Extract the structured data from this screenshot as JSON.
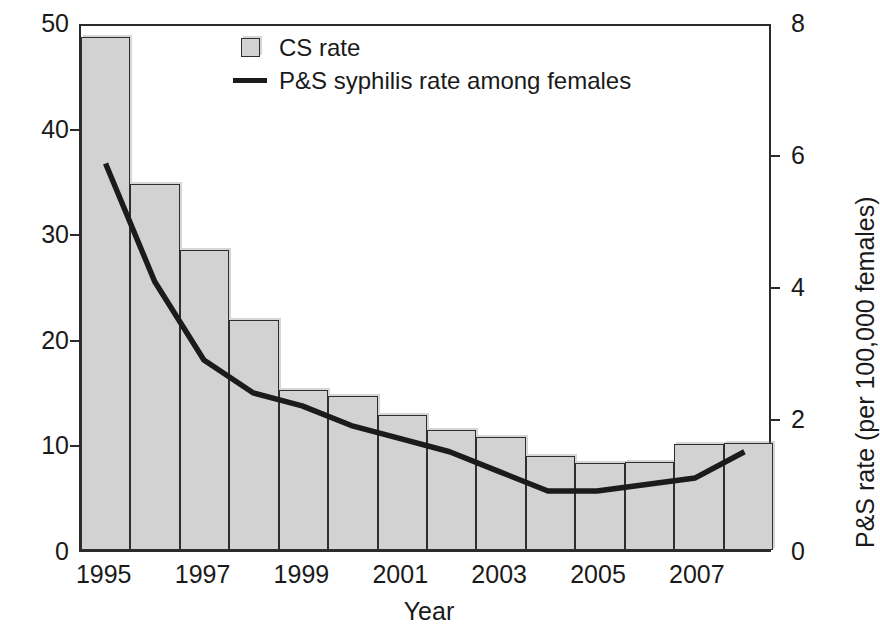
{
  "chart_data": {
    "type": "bar",
    "title": "",
    "xlabel": "Year",
    "ylabel": "CS rate (per 100,000 live births)",
    "y2label": "P&S rate (per 100,000 females)",
    "grid": false,
    "legend_position": "top-center",
    "xlim": [
      1994.5,
      2008.5
    ],
    "ylim": [
      0,
      50
    ],
    "y2lim": [
      0,
      8
    ],
    "yticks": [
      0,
      10,
      20,
      30,
      40,
      50
    ],
    "y2ticks": [
      0,
      2,
      4,
      6,
      8
    ],
    "xticks": [
      "1995",
      "1997",
      "1999",
      "2001",
      "2003",
      "2005",
      "2007"
    ],
    "xtick_values": [
      1995,
      1997,
      1999,
      2001,
      2003,
      2005,
      2007
    ],
    "categories": [
      1995,
      1996,
      1997,
      1998,
      1999,
      2000,
      2001,
      2002,
      2003,
      2004,
      2005,
      2006,
      2007,
      2008
    ],
    "series": [
      {
        "name": "CS rate",
        "type": "bar",
        "axis": "left",
        "values": [
          48.6,
          34.7,
          28.4,
          21.8,
          15.2,
          14.6,
          12.8,
          11.4,
          10.7,
          8.9,
          8.2,
          8.3,
          10.0,
          10.1
        ]
      },
      {
        "name": "P&S syphilis rate among females",
        "type": "line",
        "axis": "right",
        "values": [
          5.9,
          4.1,
          2.9,
          2.4,
          2.2,
          1.9,
          1.7,
          1.5,
          1.2,
          0.9,
          0.9,
          1.0,
          1.1,
          1.5
        ]
      }
    ],
    "legend": [
      "CS rate",
      "P&S syphilis rate among females"
    ],
    "colors": {
      "bar_fill": "#d2d2d2",
      "bar_edge": "#2e2e2e",
      "line": "#1b1b1b",
      "axis": "#2b2b2b",
      "text": "#1a1a1a",
      "background": "#ffffff"
    }
  },
  "legend": {
    "items": [
      {
        "label": "CS rate",
        "key": "bar-swatch-icon"
      },
      {
        "label": "P&S syphilis rate among females",
        "key": "line-swatch-icon"
      }
    ]
  },
  "axes": {
    "left": {
      "title": "CS rate (per 100,000 live births)",
      "ticks": [
        "0",
        "10",
        "20",
        "30",
        "40",
        "50"
      ]
    },
    "right": {
      "title": "P&S rate (per 100,000 females)",
      "ticks": [
        "0",
        "2",
        "4",
        "6",
        "8"
      ]
    },
    "bottom": {
      "title": "Year",
      "ticks": [
        "1995",
        "1997",
        "1999",
        "2001",
        "2003",
        "2005",
        "2007"
      ]
    }
  }
}
